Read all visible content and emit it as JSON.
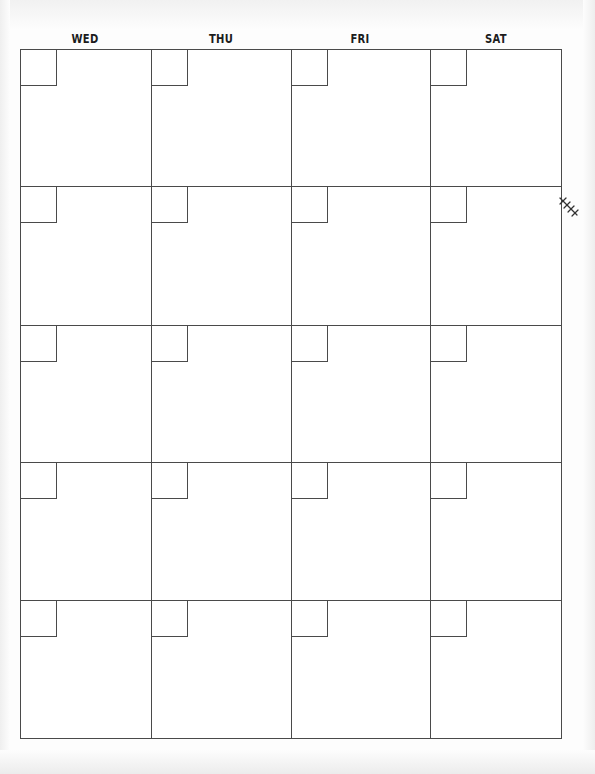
{
  "calendar": {
    "day_headers": [
      "WED",
      "THU",
      "FRI",
      "SAT"
    ],
    "rows": 5,
    "columns": 4,
    "line_color": "#4a4a4a",
    "decoration": "leaf-sprig-icon"
  }
}
